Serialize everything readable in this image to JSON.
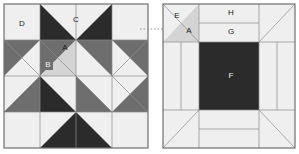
{
  "diagram": {
    "colors": {
      "background": "#ffffff",
      "light": "#efefef",
      "light_gray": "#d4d4d4",
      "medium_gray": "#6e6e6e",
      "dark": "#2b2b2b",
      "outline": "#8a8a8a",
      "label_dark": "#222222",
      "label_light": "#f2f2f2"
    },
    "connector": {
      "name": "dotted-connector",
      "style": "dotted",
      "color": "#9a9a9a"
    },
    "left_block": {
      "name": "eight-pointed-star-block",
      "caption": "",
      "bounds": {
        "x": 4,
        "y": 4,
        "width": 144,
        "height": 144
      },
      "grid": 4,
      "labels": [
        {
          "id": "D",
          "text": "D",
          "x": 22,
          "y": 24,
          "tone": "dark"
        },
        {
          "id": "C",
          "text": "C",
          "x": 76,
          "y": 20,
          "tone": "dark"
        },
        {
          "id": "A",
          "text": "A",
          "x": 65,
          "y": 48,
          "tone": "dark"
        },
        {
          "id": "B",
          "text": "B",
          "x": 48,
          "y": 64,
          "tone": "light"
        }
      ]
    },
    "right_block": {
      "name": "exploded-piecing-block",
      "caption": "",
      "bounds": {
        "x": 163,
        "y": 4,
        "width": 132,
        "height": 144
      },
      "labels": [
        {
          "id": "E",
          "text": "E",
          "x": 177,
          "y": 16,
          "tone": "dark"
        },
        {
          "id": "A",
          "text": "A",
          "x": 188,
          "y": 30,
          "tone": "dark"
        },
        {
          "id": "H",
          "text": "H",
          "x": 232,
          "y": 13,
          "tone": "dark"
        },
        {
          "id": "G",
          "text": "G",
          "x": 232,
          "y": 30,
          "tone": "dark"
        },
        {
          "id": "F",
          "text": "F",
          "x": 233,
          "y": 76,
          "tone": "light"
        }
      ]
    },
    "piece_legend": [
      {
        "id": "A",
        "description": "light half-square triangle"
      },
      {
        "id": "B",
        "description": "medium half-square triangle"
      },
      {
        "id": "C",
        "description": "light quarter-square triangle"
      },
      {
        "id": "D",
        "description": "light corner square"
      },
      {
        "id": "E",
        "description": "light corner square"
      },
      {
        "id": "F",
        "description": "dark center square"
      },
      {
        "id": "G",
        "description": "inner border strip"
      },
      {
        "id": "H",
        "description": "outer border strip"
      }
    ]
  }
}
